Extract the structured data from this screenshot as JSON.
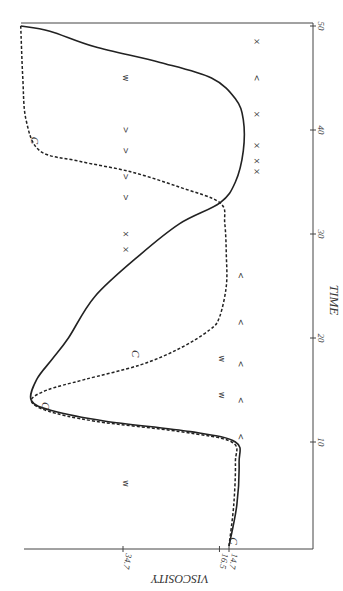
{
  "chart_data": {
    "type": "line",
    "orientation": "rotated-90-ccw",
    "title": "",
    "xlabel": "TIME",
    "ylabel": "VISCOSITY",
    "x_ticks": [
      10,
      20,
      30,
      40,
      50
    ],
    "x_tick_labels": [
      "10",
      "20",
      "30",
      "40",
      "50"
    ],
    "xlim": [
      0,
      50
    ],
    "y_ticks": [
      14.7,
      16.5,
      34.7
    ],
    "y_tick_labels": [
      "14.7",
      "16.5",
      "34.7"
    ],
    "grid": false,
    "legend": null,
    "series": [
      {
        "name": "solid curve",
        "style": "solid",
        "x": [
          0,
          4,
          8,
          10,
          11,
          12,
          13,
          14,
          16,
          18,
          20,
          24,
          28,
          31,
          33,
          35,
          38,
          41,
          43,
          45,
          46.5,
          48,
          49.5,
          50
        ],
        "values": [
          14.7,
          13.2,
          12.8,
          13.5,
          22,
          38,
          48,
          52,
          51,
          48,
          45,
          40,
          31.5,
          24,
          16.4,
          13.5,
          12,
          12,
          13.5,
          18,
          27.7,
          40,
          48.5,
          54
        ]
      },
      {
        "name": "dashed curve",
        "style": "dashed",
        "x": [
          0,
          4,
          8,
          10,
          11,
          12,
          13,
          14,
          15,
          16,
          17.4,
          19,
          20.8,
          22,
          25,
          28,
          31,
          33,
          34.5,
          36,
          37,
          38,
          41,
          45,
          50
        ],
        "values": [
          14.7,
          13.8,
          13.5,
          14.2,
          24,
          40,
          49,
          52,
          49,
          42,
          31.5,
          24,
          18.3,
          16.5,
          15.2,
          15.2,
          15.5,
          16.4,
          24,
          33.4,
          43,
          50.4,
          53,
          53.6,
          54
        ]
      }
    ],
    "annotations": [
      {
        "label": "C",
        "time": 13.5,
        "viscosity": 50
      },
      {
        "label": "C",
        "time": 18.5,
        "viscosity": 33
      },
      {
        "label": "C",
        "time": 39,
        "viscosity": 52
      },
      {
        "label": "C",
        "time": 0.5,
        "viscosity": 14.5
      }
    ],
    "scatter_markers": [
      {
        "glyph": "×",
        "time": 48.5,
        "viscosity": 10
      },
      {
        "glyph": "<",
        "time": 45,
        "viscosity": 10
      },
      {
        "glyph": "w",
        "time": 45,
        "viscosity": 34.7
      },
      {
        "glyph": "×",
        "time": 41.5,
        "viscosity": 10
      },
      {
        "glyph": ">",
        "time": 40,
        "viscosity": 34.7
      },
      {
        "glyph": "×",
        "time": 38.5,
        "viscosity": 10
      },
      {
        "glyph": ">",
        "time": 38,
        "viscosity": 34.7
      },
      {
        "glyph": "×",
        "time": 37,
        "viscosity": 10
      },
      {
        "glyph": "×",
        "time": 36,
        "viscosity": 10
      },
      {
        "glyph": ">",
        "time": 35.5,
        "viscosity": 34.7
      },
      {
        "glyph": ">",
        "time": 33.5,
        "viscosity": 34.7
      },
      {
        "glyph": "×",
        "time": 30,
        "viscosity": 34.7
      },
      {
        "glyph": "×",
        "time": 28.5,
        "viscosity": 34.7
      },
      {
        "glyph": "<",
        "time": 26,
        "viscosity": 13
      },
      {
        "glyph": "<",
        "time": 21.5,
        "viscosity": 13
      },
      {
        "glyph": "w",
        "time": 18,
        "viscosity": 16.5
      },
      {
        "glyph": "<",
        "time": 17.5,
        "viscosity": 13
      },
      {
        "glyph": "w",
        "time": 14.5,
        "viscosity": 16.5
      },
      {
        "glyph": "<",
        "time": 14,
        "viscosity": 13
      },
      {
        "glyph": "<",
        "time": 10.5,
        "viscosity": 13
      },
      {
        "glyph": "w",
        "time": 6,
        "viscosity": 34.7
      }
    ]
  }
}
